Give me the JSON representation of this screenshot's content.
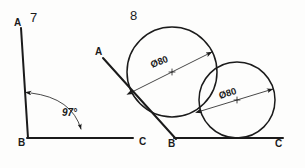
{
  "sheet": {
    "title": "Geometry construction worksheet",
    "background_color": "#fdfdfc",
    "ink_color": "#1b1b1b",
    "width": 305,
    "height": 168
  },
  "figures": [
    {
      "id": "figure-7",
      "number": "7",
      "number_pos": {
        "x": 30,
        "y": 22
      },
      "description": "Angle ABC of 97 degrees with dimension arc",
      "vertices": [
        {
          "name": "A",
          "label": "A",
          "label_x": 14,
          "label_y": 26,
          "pt_x": 21,
          "pt_y": 28
        },
        {
          "name": "B",
          "label": "B",
          "label_x": 18,
          "label_y": 146,
          "pt_x": 28,
          "pt_y": 138
        },
        {
          "name": "C",
          "label": "C",
          "label_x": 139,
          "label_y": 145,
          "pt_x": 133,
          "pt_y": 138
        }
      ],
      "angle": {
        "value": "97",
        "unit": "°",
        "text": "97°",
        "text_x": 62,
        "text_y": 116
      }
    },
    {
      "id": "figure-8",
      "number": "8",
      "number_pos": {
        "x": 130,
        "y": 20
      },
      "description": "Two equal circles tangent to line AB and line BC",
      "vertices": [
        {
          "name": "A",
          "label": "A",
          "label_x": 95,
          "label_y": 55,
          "pt_x": 103,
          "pt_y": 58
        },
        {
          "name": "B",
          "label": "B",
          "label_x": 168,
          "label_y": 147,
          "pt_x": 175,
          "pt_y": 139
        },
        {
          "name": "C",
          "label": "C",
          "label_x": 275,
          "label_y": 147,
          "pt_x": 270,
          "pt_y": 138
        }
      ],
      "circles": [
        {
          "id": "circle-left",
          "cx": 172,
          "cy": 72,
          "r": 45,
          "dimension": {
            "symbol": "Ø",
            "value": "80",
            "text": "Ø80",
            "text_x": 152,
            "text_y": 68,
            "rotation": -21
          }
        },
        {
          "id": "circle-right",
          "cx": 237,
          "cy": 100,
          "r": 38,
          "dimension": {
            "symbol": "Ø",
            "value": "80",
            "text": "Ø80",
            "text_x": 220,
            "text_y": 99,
            "rotation": -17
          }
        }
      ]
    }
  ]
}
